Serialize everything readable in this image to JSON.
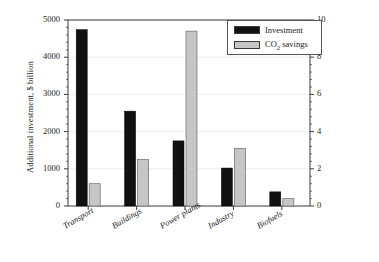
{
  "chart_data": {
    "type": "bar",
    "title": "",
    "subtitle": "",
    "categories": [
      "Transport",
      "Buildings",
      "Power plants",
      "Industry",
      "Biofuels"
    ],
    "series": [
      {
        "name": "Investment",
        "axis": "left",
        "unit": "$ billion",
        "color": "#111111",
        "values": [
          4740,
          2550,
          1750,
          1020,
          380
        ]
      },
      {
        "name": "CO2 savings",
        "axis": "right",
        "unit": "Gt CO2",
        "color": "#c6c6c6",
        "values": [
          1.2,
          2.5,
          9.4,
          3.1,
          0.4
        ]
      }
    ],
    "xlabel": "",
    "ylabel_left": "Additional investment, $ billion",
    "ylabel_right": "CO2 savings, Gt CO2",
    "ylim_left": [
      0,
      5000
    ],
    "ylim_right": [
      0,
      10
    ],
    "yticks_left": [
      "0",
      "1000",
      "2000",
      "3000",
      "4000",
      "5000"
    ],
    "yticks_right": [
      "0",
      "2",
      "4",
      "6",
      "8",
      "10"
    ],
    "grid": true,
    "grid_axis": "y",
    "legend_position": "top-right",
    "legend_entries": [
      "Investment",
      "CO2 savings"
    ],
    "xtick_rotation_degrees": 30
  },
  "axes": {
    "left_title_prefix": "Additional investment, $ billion",
    "right_title_pre": "CO",
    "right_title_sub1": "2",
    "right_title_mid": " savings, Gt CO",
    "right_title_sub2": "2"
  },
  "legend": {
    "investment_label": "Investment",
    "co2_pre": "CO",
    "co2_sub": "2",
    "co2_post": " savings"
  },
  "colors": {
    "investment": "#111111",
    "co2": "#c6c6c6",
    "axis": "#3a3a3a",
    "grid": "#ededed",
    "text": "#1a1a1a"
  }
}
